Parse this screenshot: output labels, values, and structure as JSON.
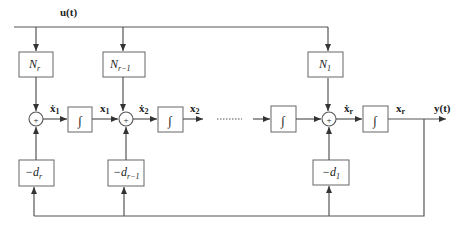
{
  "diagram": {
    "type": "block-diagram",
    "input_label": "u(t)",
    "output_label": "y(t)",
    "input_gains": [
      {
        "id": "Nr",
        "base": "N",
        "sub": "r"
      },
      {
        "id": "Nr-1",
        "base": "N",
        "sub": "r−1"
      },
      {
        "id": "N1",
        "base": "N",
        "sub": "1"
      }
    ],
    "feedback_gains": [
      {
        "id": "-dr",
        "base": "−d",
        "sub": "r"
      },
      {
        "id": "-dr-1",
        "base": "−d",
        "sub": "r−1"
      },
      {
        "id": "-d1",
        "base": "−d",
        "sub": "1"
      }
    ],
    "summing_junctions": [
      {
        "id": "sum1",
        "sign": "+"
      },
      {
        "id": "sum2",
        "sign": "+"
      },
      {
        "id": "sumr",
        "sign": "+"
      }
    ],
    "integrators": [
      {
        "id": "int1",
        "symbol": "∫"
      },
      {
        "id": "int2",
        "symbol": "∫"
      },
      {
        "id": "int-mid",
        "symbol": "∫"
      },
      {
        "id": "intr",
        "symbol": "∫"
      }
    ],
    "signals": [
      {
        "id": "xdot1",
        "base": "ẋ",
        "sub": "1"
      },
      {
        "id": "x1",
        "base": "x",
        "sub": "1"
      },
      {
        "id": "xdot2",
        "base": "ẋ",
        "sub": "2"
      },
      {
        "id": "x2",
        "base": "x",
        "sub": "2"
      },
      {
        "id": "xdotr",
        "base": "ẋ",
        "sub": "r"
      },
      {
        "id": "xr",
        "base": "x",
        "sub": "r"
      }
    ],
    "ellipsis": "......"
  }
}
